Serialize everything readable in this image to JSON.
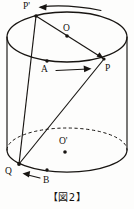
{
  "figure": {
    "caption": "【図2】",
    "shape": "cylinder",
    "stroke_color": "#181512",
    "background_color": "#fdfdfc",
    "labels": {
      "p_prime": "P'",
      "o": "O",
      "a": "A",
      "p": "P",
      "o_prime": "O'",
      "q": "Q",
      "b": "B"
    },
    "points": [
      {
        "name": "P'",
        "x": 36,
        "y": 16,
        "on": "top-circle",
        "dot": true
      },
      {
        "name": "O",
        "x": 67,
        "y": 36,
        "on": "top-circle-center",
        "dot": true
      },
      {
        "name": "A",
        "x": 47,
        "y": 61,
        "on": "top-circle",
        "dot": true
      },
      {
        "name": "P",
        "x": 104,
        "y": 59,
        "on": "top-circle",
        "dot": true
      },
      {
        "name": "O'",
        "x": 65,
        "y": 152,
        "on": "bottom-circle-center",
        "dot": true
      },
      {
        "name": "Q",
        "x": 19,
        "y": 164,
        "on": "bottom-circle",
        "dot": true
      },
      {
        "name": "B",
        "x": 47,
        "y": 170,
        "on": "bottom-circle",
        "dot": true
      }
    ],
    "top_ellipse": {
      "cx": 67,
      "cy": 37,
      "rx": 60,
      "ry": 25
    },
    "bottom_ellipse": {
      "cx": 67,
      "cy": 150,
      "rx": 60,
      "ry": 22
    },
    "side_lines": [
      {
        "x1": 7,
        "y1": 37,
        "x2": 7,
        "y2": 150
      },
      {
        "x1": 127,
        "y1": 37,
        "x2": 127,
        "y2": 150
      }
    ],
    "segments": [
      {
        "name": "P'-P diameter",
        "from": "P'",
        "to": "P",
        "style": "solid"
      },
      {
        "name": "P'-Q",
        "from": "P'",
        "to": "Q",
        "style": "solid"
      },
      {
        "name": "P-Q",
        "from": "P",
        "to": "Q",
        "style": "solid"
      }
    ],
    "arrows": [
      {
        "name": "top-arrow",
        "direction": "left",
        "from_x": 100,
        "from_y": 9,
        "to_x": 40,
        "to_y": 7
      },
      {
        "name": "middle-arrow",
        "direction": "right",
        "from_x": 57,
        "from_y": 70,
        "to_x": 92,
        "to_y": 68
      },
      {
        "name": "bottom-arrow",
        "direction": "left",
        "from_x": 40,
        "from_y": 178,
        "to_x": 22,
        "to_y": 173
      }
    ]
  }
}
